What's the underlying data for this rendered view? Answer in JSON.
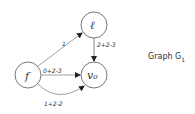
{
  "diagram": {
    "caption": {
      "text": "Graph G",
      "subscript": "1"
    },
    "nodes": [
      {
        "id": "l",
        "label": "ℓ",
        "cx": 94,
        "cy": 25,
        "r": 13
      },
      {
        "id": "v0",
        "label": "v₀",
        "cx": 94,
        "cy": 75,
        "r": 13
      },
      {
        "id": "f",
        "label": "f",
        "cx": 28,
        "cy": 75,
        "r": 13
      }
    ],
    "edges": [
      {
        "from": "f",
        "to": "l",
        "label": "1"
      },
      {
        "from": "l",
        "to": "v0",
        "label": "2+2-3"
      },
      {
        "from": "f",
        "to": "v0",
        "label": "0+2-3"
      },
      {
        "from": "f",
        "to": "v0",
        "label": "1+2-2",
        "curved": true
      }
    ],
    "colors": {
      "stroke": "#444444",
      "text": "#333333",
      "background": "#ffffff"
    }
  }
}
